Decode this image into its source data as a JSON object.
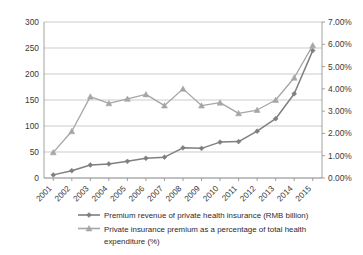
{
  "chart_data": {
    "type": "line",
    "title": "",
    "xlabel": "",
    "categories": [
      "2001",
      "2002",
      "2003",
      "2004",
      "2005",
      "2006",
      "2007",
      "2008",
      "2009",
      "2010",
      "2011",
      "2012",
      "2013",
      "2014",
      "2015"
    ],
    "grid": true,
    "legend_position": "bottom",
    "axes": {
      "left": {
        "label": "",
        "ylim": [
          0,
          300
        ],
        "tick_step": 50,
        "ticks": [
          "0",
          "50",
          "100",
          "150",
          "200",
          "250",
          "300"
        ]
      },
      "right": {
        "label": "",
        "ylim": [
          0,
          7
        ],
        "tick_step": 1,
        "ticks": [
          "0.00%",
          "1.00%",
          "2.00%",
          "3.00%",
          "4.00%",
          "5.00%",
          "6.00%",
          "7.00%"
        ]
      }
    },
    "series": [
      {
        "name": "Premium revenue of private health insurance (RMB billion)",
        "axis": "left",
        "color": "#7f7f7f",
        "marker": "diamond",
        "values": [
          6,
          14,
          25,
          27,
          32,
          38,
          40,
          58,
          57,
          69,
          70,
          90,
          114,
          162,
          245
        ]
      },
      {
        "name": "Private insurance premium as a percentage of total health expenditure (%)",
        "axis": "right",
        "color": "#a6a6a6",
        "marker": "triangle",
        "values": [
          1.15,
          2.1,
          3.65,
          3.35,
          3.55,
          3.75,
          3.25,
          4.0,
          3.25,
          3.38,
          2.9,
          3.05,
          3.5,
          4.5,
          5.95
        ]
      }
    ]
  },
  "legend": {
    "items": [
      {
        "label": "Premium revenue of private health insurance (RMB billion)"
      },
      {
        "label": "Private insurance premium as a percentage of total health"
      },
      {
        "label": "expenditure (%)"
      }
    ]
  }
}
